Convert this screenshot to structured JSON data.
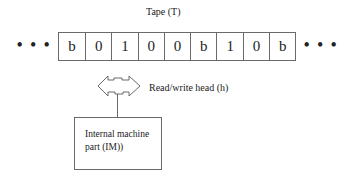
{
  "tape": {
    "label": "Tape (T)",
    "cells": [
      "b",
      "0",
      "1",
      "0",
      "0",
      "b",
      "1",
      "0",
      "b"
    ],
    "left_ellipsis": [
      "•",
      "•",
      "•"
    ],
    "right_ellipsis": [
      "•",
      "•",
      "•"
    ]
  },
  "head": {
    "label": "Read/write head (h)",
    "icon": "double-arrow-head-icon"
  },
  "internal_machine": {
    "line1": "Internal machine",
    "line2": "part (IM))"
  },
  "colors": {
    "stroke": "#6a6a6a",
    "text": "#222222",
    "background": "#ffffff"
  }
}
